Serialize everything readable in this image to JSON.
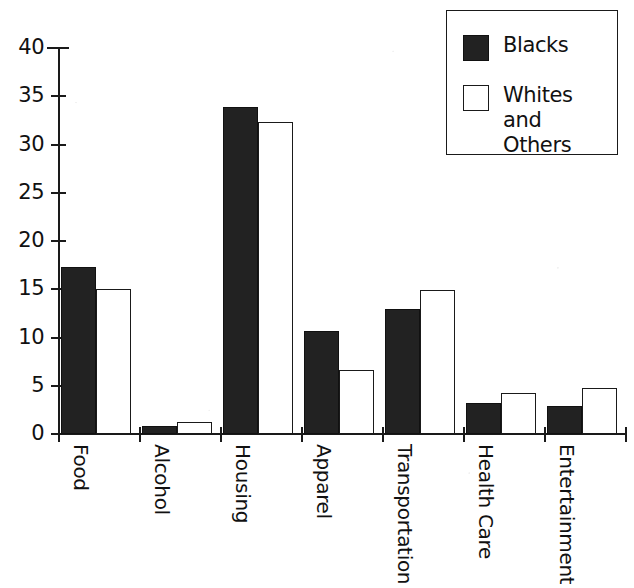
{
  "chart_data": {
    "type": "bar",
    "title": "",
    "xlabel": "",
    "ylabel": "",
    "ylim": [
      0,
      40
    ],
    "ytick_step": 5,
    "yticks": [
      0,
      5,
      10,
      15,
      20,
      25,
      30,
      35,
      40
    ],
    "ytick_labels": [
      "0",
      "5",
      "10",
      "15",
      "20",
      "25",
      "30",
      "35",
      "40"
    ],
    "grid": false,
    "legend_position": "top-right",
    "categories": [
      "Food",
      "Alcohol",
      "Housing",
      "Apparel",
      "Transportation",
      "Health Care",
      "Entertainment"
    ],
    "series": [
      {
        "name": "Blacks",
        "color": "#222222",
        "style": "filled",
        "values": [
          17.3,
          0.8,
          33.9,
          10.7,
          13.0,
          3.2,
          2.9
        ]
      },
      {
        "name": "Whites and Others",
        "color": "#ffffff",
        "style": "open",
        "values": [
          15.0,
          1.2,
          32.3,
          6.6,
          14.9,
          4.2,
          4.8
        ]
      }
    ]
  },
  "legend": {
    "entries": [
      {
        "label": "Blacks",
        "swatch": "filled-square-icon"
      },
      {
        "label": "Whites and Others",
        "swatch": "open-square-icon"
      }
    ]
  },
  "axis": {
    "y_label_texts": [
      "40",
      "35",
      "30",
      "25",
      "20",
      "15",
      "10",
      "5",
      "0"
    ]
  },
  "colors": {
    "ink": "#1a1a1a",
    "bar_filled": "#222222",
    "bar_open": "#ffffff",
    "page": "#ffffff"
  }
}
